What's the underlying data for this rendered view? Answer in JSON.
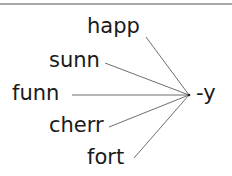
{
  "diagram": {
    "type": "word-suffix-matching",
    "stems": [
      {
        "text": "happ",
        "x": 87,
        "y": 16
      },
      {
        "text": "sunn",
        "x": 49,
        "y": 50
      },
      {
        "text": "funn",
        "x": 12,
        "y": 82
      },
      {
        "text": "cherr",
        "x": 49,
        "y": 114
      },
      {
        "text": "fort",
        "x": 87,
        "y": 147
      }
    ],
    "suffix": {
      "text": "-y",
      "x": 196,
      "y": 82
    },
    "connectors": [
      {
        "from": [
          146,
          37
        ],
        "to": [
          189,
          95
        ]
      },
      {
        "from": [
          105,
          63
        ],
        "to": [
          189,
          95
        ]
      },
      {
        "from": [
          72,
          95
        ],
        "to": [
          189,
          95
        ]
      },
      {
        "from": [
          109,
          127
        ],
        "to": [
          189,
          95
        ]
      },
      {
        "from": [
          134,
          158
        ],
        "to": [
          189,
          95
        ]
      }
    ],
    "line_color": "#6f6f6f"
  }
}
